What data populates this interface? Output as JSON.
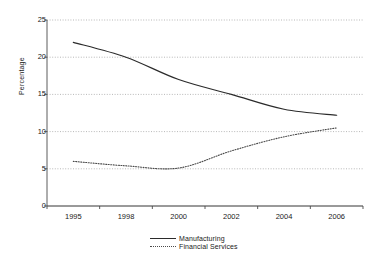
{
  "chart_data": {
    "type": "line",
    "title": "",
    "xlabel": "",
    "ylabel": "Percentage",
    "x": [
      "1995",
      "1998",
      "2000",
      "2002",
      "2004",
      "2006"
    ],
    "categories": [
      "1995",
      "1998",
      "2000",
      "2002",
      "2004",
      "2006"
    ],
    "xtick_labels": [
      "1995",
      "1998",
      "2000",
      "2002",
      "2004",
      "2006"
    ],
    "ytick_labels": [
      "0",
      "5",
      "10",
      "15",
      "20",
      "25"
    ],
    "yticks": [
      0,
      5,
      10,
      15,
      20,
      25
    ],
    "ylim": [
      0,
      25
    ],
    "grid": true,
    "grid_style": "dotted-horizontal",
    "legend_position": "bottom-center",
    "series": [
      {
        "name": "Manufacturing",
        "style": "solid",
        "color": "#2b2b2b",
        "values": [
          22.0,
          20.0,
          17.0,
          15.0,
          13.0,
          12.2
        ]
      },
      {
        "name": "Financial Services",
        "style": "dotted",
        "color": "#4a4a4a",
        "values": [
          6.0,
          5.4,
          5.1,
          7.4,
          9.3,
          10.5
        ]
      }
    ]
  },
  "legend": {
    "items": [
      {
        "label": "Manufacturing",
        "style": "solid"
      },
      {
        "label": "Financial Services",
        "style": "dotted"
      }
    ]
  }
}
